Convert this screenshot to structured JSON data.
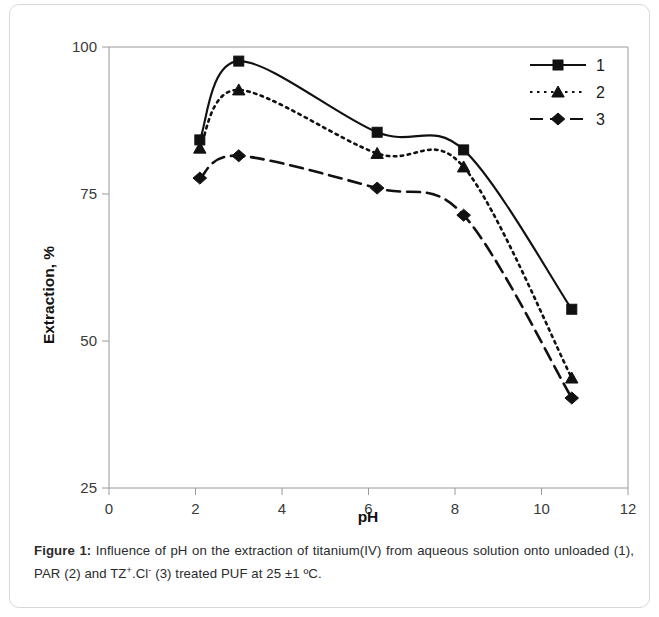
{
  "figure": {
    "caption_label": "Figure 1:",
    "caption_text": " Influence of pH on the extraction of titanium(IV) from aqueous solution onto unloaded (1), PAR (2) and TZ",
    "caption_sup1": "+",
    "caption_mid": ".Cl",
    "caption_sup2": "-",
    "caption_tail": " (3) treated PUF at 25 ±1 ºC."
  },
  "chart_data": {
    "type": "line",
    "title": "",
    "xlabel": "pH",
    "ylabel": "Extraction, %",
    "xlim": [
      0,
      12
    ],
    "ylim": [
      25,
      100
    ],
    "xticks": [
      0,
      2,
      4,
      6,
      8,
      10,
      12
    ],
    "yticks": [
      25,
      50,
      75,
      100
    ],
    "xtick_labels": [
      "0",
      "2",
      "4",
      "6",
      "8",
      "10",
      "12"
    ],
    "ytick_labels": [
      "25",
      "50",
      "75",
      "100"
    ],
    "grid": false,
    "legend_position": "top-right",
    "x": [
      2.1,
      3.0,
      6.2,
      8.2,
      10.7
    ],
    "series": [
      {
        "name": "1",
        "label": "1",
        "marker": "square",
        "line_style": "solid",
        "color": "#111111",
        "values": [
          84.2,
          97.6,
          85.5,
          82.5,
          55.4
        ]
      },
      {
        "name": "2",
        "label": "2",
        "marker": "triangle",
        "line_style": "dotted",
        "color": "#111111",
        "values": [
          82.8,
          92.7,
          81.9,
          79.6,
          43.7
        ]
      },
      {
        "name": "3",
        "label": "3",
        "marker": "diamond",
        "line_style": "dashed",
        "color": "#111111",
        "values": [
          77.7,
          81.5,
          76.0,
          71.4,
          40.3
        ]
      }
    ]
  }
}
